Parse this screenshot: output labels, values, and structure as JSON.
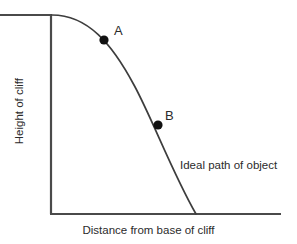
{
  "figure": {
    "title_alt": "Ideal projectile path from a cliff",
    "background_color": "#ffffff",
    "line_color": "#4a4a4a",
    "curve_color": "#3d3d3d",
    "marker_color": "#111111",
    "text_color": "#2b2b2b"
  },
  "axes": {
    "x_label": "Distance from base of cliff",
    "y_label": "Height of cliff",
    "origin_px": {
      "x": 51,
      "y": 214
    },
    "x_axis_end_px": {
      "x": 281,
      "y": 214
    },
    "y_axis_top_px": {
      "x": 51,
      "y": 15
    },
    "ticks": [],
    "grid": false
  },
  "annotations": {
    "curve_label": "Ideal path of object",
    "point_a_label": "A",
    "point_b_label": "B"
  },
  "markers": [
    {
      "label": "A",
      "cx": 104,
      "cy": 40,
      "r": 4.6
    },
    {
      "label": "B",
      "cx": 158,
      "cy": 125,
      "r": 4.6
    }
  ],
  "chart_data": {
    "type": "line",
    "title": "",
    "xlabel": "Distance from base of cliff",
    "ylabel": "Height of cliff",
    "grid": false,
    "legend": "none",
    "series": [
      {
        "name": "Ideal path of object",
        "description": "Parabolic trajectory of an object launched horizontally from the top of a cliff",
        "x": [
          0,
          10,
          20,
          30,
          40,
          50,
          60,
          70,
          80,
          90,
          100
        ],
        "y": [
          100,
          99,
          96,
          91,
          84,
          75,
          64,
          51,
          36,
          19,
          0
        ],
        "path_px": "M 52,15 C 88,15 112,44 134,85 C 152,118 172,172 196,214"
      }
    ],
    "points": [
      {
        "name": "A",
        "x": 26,
        "y": 93,
        "px": {
          "x": 104,
          "y": 40
        }
      },
      {
        "name": "B",
        "x": 58,
        "y": 66,
        "px": {
          "x": 158,
          "y": 125
        }
      }
    ],
    "cliff_top": {
      "description": "Horizontal line representing the cliff top edge",
      "from_px": {
        "x": 0,
        "y": 15
      },
      "to_px": {
        "x": 52,
        "y": 15
      }
    },
    "xlim": [
      0,
      115
    ],
    "ylim": [
      0,
      100
    ]
  }
}
